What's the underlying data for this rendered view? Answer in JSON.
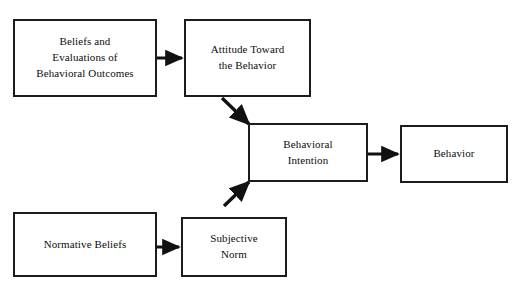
{
  "diagram": {
    "background_color": "#ffffff",
    "line_color": "#111111",
    "text_color": "#0d0d0d",
    "nodes": [
      {
        "id": "beliefs",
        "label": "Beliefs and\nEvaluations of\nBehavioral Outcomes"
      },
      {
        "id": "attitude",
        "label": "Attitude Toward\nthe Behavior"
      },
      {
        "id": "intention",
        "label": "Behavioral\nIntention"
      },
      {
        "id": "behavior",
        "label": "Behavior"
      },
      {
        "id": "normative",
        "label": "Normative Beliefs"
      },
      {
        "id": "subjective",
        "label": "Subjective\nNorm"
      }
    ],
    "edges": [
      {
        "id": "beliefs-to-attitude",
        "from": "beliefs",
        "to": "attitude",
        "style": "horizontal"
      },
      {
        "id": "attitude-to-intention",
        "from": "attitude",
        "to": "intention",
        "style": "diagonal-down"
      },
      {
        "id": "intention-to-behavior",
        "from": "intention",
        "to": "behavior",
        "style": "horizontal"
      },
      {
        "id": "normative-to-subjective",
        "from": "normative",
        "to": "subjective",
        "style": "horizontal"
      },
      {
        "id": "subjective-to-intention",
        "from": "subjective",
        "to": "intention",
        "style": "diagonal-up"
      }
    ]
  }
}
